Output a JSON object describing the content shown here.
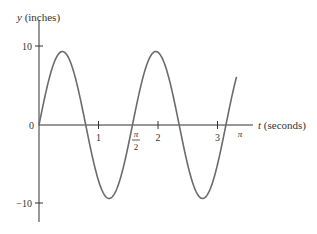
{
  "chart_data": {
    "type": "line",
    "title": "",
    "xlabel": "t (seconds)",
    "xlabel_var": "t",
    "xlabel_unit": "(seconds)",
    "ylabel": "y (inches)",
    "ylabel_var": "y",
    "ylabel_unit": "(inches)",
    "function": "y ≈ 9.3 sin(4t)",
    "amplitude": 9.3,
    "angular_frequency": 4,
    "xlim": [
      0,
      3.3
    ],
    "ylim": [
      -12,
      13
    ],
    "x_ticks": [
      {
        "value": 1,
        "label": "1"
      },
      {
        "value": 2,
        "label": "2"
      },
      {
        "value": 3,
        "label": "3"
      }
    ],
    "x_special_ticks": [
      {
        "value": 1.5708,
        "label_num": "π",
        "label_den": "2"
      },
      {
        "value": 3.1416,
        "label": "π"
      }
    ],
    "y_ticks": [
      {
        "value": 10,
        "label": "10"
      },
      {
        "value": -10,
        "label": "−10"
      }
    ],
    "origin_label": "0",
    "grid": false,
    "legend": null,
    "series": [
      {
        "name": "y(t)",
        "color": "#6b6b6b",
        "x": [
          0,
          0.196,
          0.393,
          0.589,
          0.785,
          0.982,
          1.178,
          1.374,
          1.571,
          1.767,
          1.963,
          2.16,
          2.356,
          2.553,
          2.749,
          2.945,
          3.142,
          3.3
        ],
        "y": [
          0,
          6.6,
          9.3,
          6.6,
          0,
          -6.6,
          -9.3,
          -6.6,
          0,
          6.6,
          9.3,
          6.6,
          0,
          -6.6,
          -9.3,
          -6.6,
          0,
          5.3
        ]
      }
    ]
  },
  "colors": {
    "curve": "#6b6b6b",
    "axis": "#333333",
    "text": "#333333",
    "background": "#ffffff"
  }
}
